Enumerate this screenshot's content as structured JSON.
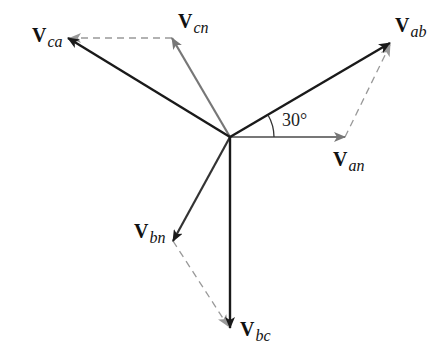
{
  "diagram": {
    "type": "phasor diagram",
    "colors": {
      "line_voltage": "#1a1a1a",
      "phase_voltage": "#777777",
      "dashed": "#999999",
      "background": "#ffffff"
    },
    "origin": [
      230,
      137
    ],
    "phasors": [
      {
        "id": "Van",
        "label_main": "V",
        "label_sub": "an",
        "kind": "phase",
        "tip": [
          345,
          137
        ]
      },
      {
        "id": "Vbn",
        "label_main": "V",
        "label_sub": "bn",
        "kind": "phase",
        "tip": [
          173,
          241
        ]
      },
      {
        "id": "Vcn",
        "label_main": "V",
        "label_sub": "cn",
        "kind": "phase",
        "tip": [
          172,
          38
        ]
      },
      {
        "id": "Vab",
        "label_main": "V",
        "label_sub": "ab",
        "kind": "line",
        "tip": [
          390,
          43
        ]
      },
      {
        "id": "Vbc",
        "label_main": "V",
        "label_sub": "bc",
        "kind": "line",
        "tip": [
          230,
          328
        ]
      },
      {
        "id": "Vca",
        "label_main": "V",
        "label_sub": "ca",
        "kind": "line",
        "tip": [
          68,
          38
        ]
      }
    ],
    "dashed_segments": [
      {
        "from": "Van",
        "to": "Vab"
      },
      {
        "from": "Vbn",
        "to": "Vbc"
      },
      {
        "from": "Vcn",
        "to": "Vca"
      }
    ],
    "angle_annotation": {
      "text": "30°",
      "between": [
        "Van",
        "Vab"
      ]
    }
  }
}
